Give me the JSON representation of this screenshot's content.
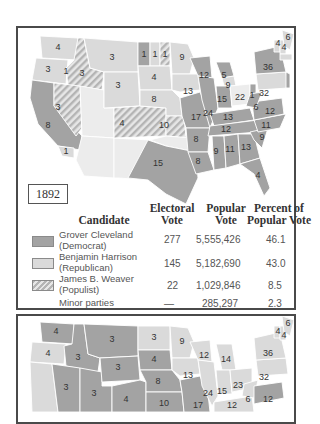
{
  "colors": {
    "democrat": "#a3a3a3",
    "republican": "#dadada",
    "populist_stripe_a": "#b4b4b4",
    "populist_stripe_b": "#e6e6e6",
    "state_border": "#ffffff",
    "frame": "#4a4a4a"
  },
  "map1": {
    "year": "1892",
    "states": [
      {
        "abbr": "WA",
        "ev": "4",
        "party": "rep"
      },
      {
        "abbr": "OR",
        "ev": "3",
        "party": "rep"
      },
      {
        "abbr": "OR-pop",
        "ev": "1",
        "party": "pop"
      },
      {
        "abbr": "ID",
        "ev": "3",
        "party": "pop"
      },
      {
        "abbr": "CA",
        "ev": "8",
        "party": "dem"
      },
      {
        "abbr": "CA-rep",
        "ev": "1",
        "party": "rep"
      },
      {
        "abbr": "NV",
        "ev": "3",
        "party": "pop"
      },
      {
        "abbr": "MT",
        "ev": "3",
        "party": "rep"
      },
      {
        "abbr": "WY",
        "ev": "3",
        "party": "rep"
      },
      {
        "abbr": "CO",
        "ev": "4",
        "party": "pop"
      },
      {
        "abbr": "ND-dem",
        "ev": "1",
        "party": "dem"
      },
      {
        "abbr": "ND-rep",
        "ev": "1",
        "party": "rep"
      },
      {
        "abbr": "ND-pop",
        "ev": "1",
        "party": "pop"
      },
      {
        "abbr": "SD",
        "ev": "4",
        "party": "rep"
      },
      {
        "abbr": "NE",
        "ev": "8",
        "party": "rep"
      },
      {
        "abbr": "KS",
        "ev": "10",
        "party": "pop"
      },
      {
        "abbr": "TX",
        "ev": "15",
        "party": "dem"
      },
      {
        "abbr": "MN",
        "ev": "9",
        "party": "rep"
      },
      {
        "abbr": "IA",
        "ev": "13",
        "party": "rep"
      },
      {
        "abbr": "MO",
        "ev": "17",
        "party": "dem"
      },
      {
        "abbr": "AR",
        "ev": "8",
        "party": "dem"
      },
      {
        "abbr": "LA",
        "ev": "8",
        "party": "dem"
      },
      {
        "abbr": "WI",
        "ev": "12",
        "party": "dem"
      },
      {
        "abbr": "IL",
        "ev": "24",
        "party": "dem"
      },
      {
        "abbr": "MI-dem",
        "ev": "5",
        "party": "dem"
      },
      {
        "abbr": "MI-rep",
        "ev": "9",
        "party": "rep"
      },
      {
        "abbr": "IN",
        "ev": "15",
        "party": "dem"
      },
      {
        "abbr": "OH-rep",
        "ev": "22",
        "party": "rep"
      },
      {
        "abbr": "OH-dem",
        "ev": "1",
        "party": "dem"
      },
      {
        "abbr": "KY",
        "ev": "13",
        "party": "dem"
      },
      {
        "abbr": "TN",
        "ev": "12",
        "party": "dem"
      },
      {
        "abbr": "MS",
        "ev": "9",
        "party": "dem"
      },
      {
        "abbr": "AL",
        "ev": "11",
        "party": "dem"
      },
      {
        "abbr": "GA",
        "ev": "13",
        "party": "dem"
      },
      {
        "abbr": "FL",
        "ev": "4",
        "party": "dem"
      },
      {
        "abbr": "SC",
        "ev": "9",
        "party": "dem"
      },
      {
        "abbr": "NC",
        "ev": "11",
        "party": "dem"
      },
      {
        "abbr": "VA",
        "ev": "12",
        "party": "dem"
      },
      {
        "abbr": "WV",
        "ev": "6",
        "party": "dem"
      },
      {
        "abbr": "PA",
        "ev": "32",
        "party": "rep"
      },
      {
        "abbr": "NY",
        "ev": "36",
        "party": "dem"
      },
      {
        "abbr": "VT",
        "ev": "4",
        "party": "rep"
      },
      {
        "abbr": "NH",
        "ev": "4",
        "party": "rep"
      },
      {
        "abbr": "ME",
        "ev": "6",
        "party": "rep"
      },
      {
        "abbr": "MA",
        "ev": "15",
        "party": "rep"
      },
      {
        "abbr": "RI",
        "ev": "4",
        "party": "rep"
      },
      {
        "abbr": "CT",
        "ev": "6",
        "party": "dem"
      },
      {
        "abbr": "NJ",
        "ev": "10",
        "party": "dem"
      },
      {
        "abbr": "DE",
        "ev": "3",
        "party": "dem"
      },
      {
        "abbr": "MD",
        "ev": "8",
        "party": "dem"
      }
    ]
  },
  "table": {
    "headers": {
      "candidate": "Candidate",
      "electoral_1": "Electoral",
      "electoral_2": "Vote",
      "popular_1": "Popular",
      "popular_2": "Vote",
      "percent_1": "Percent of",
      "percent_2": "Popular Vote"
    },
    "rows": [
      {
        "name_1": "Grover Cleveland",
        "name_2": "(Democrat)",
        "electoral": "277",
        "popular": "5,555,426",
        "percent": "46.1",
        "swatch": "dem"
      },
      {
        "name_1": "Benjamin Harrison",
        "name_2": "(Republican)",
        "electoral": "145",
        "popular": "5,182,690",
        "percent": "43.0",
        "swatch": "rep"
      },
      {
        "name_1": "James B. Weaver",
        "name_2": "(Populist)",
        "electoral": "22",
        "popular": "1,029,846",
        "percent": "8.5",
        "swatch": "pop"
      },
      {
        "name_1": "Minor parties",
        "name_2": "",
        "electoral": "—",
        "popular": "285,297",
        "percent": "2.3",
        "swatch": "none"
      }
    ]
  },
  "map2": {
    "labels": [
      "4",
      "4",
      "3",
      "3",
      "3",
      "3",
      "4",
      "9",
      "12",
      "14",
      "36",
      "6",
      "4",
      "4",
      "15",
      "4",
      "6",
      "13",
      "32",
      "10",
      "24",
      "15",
      "23",
      "3",
      "3",
      "4",
      "8",
      "6",
      "12",
      "8",
      "8",
      "10",
      "17",
      "12"
    ]
  }
}
